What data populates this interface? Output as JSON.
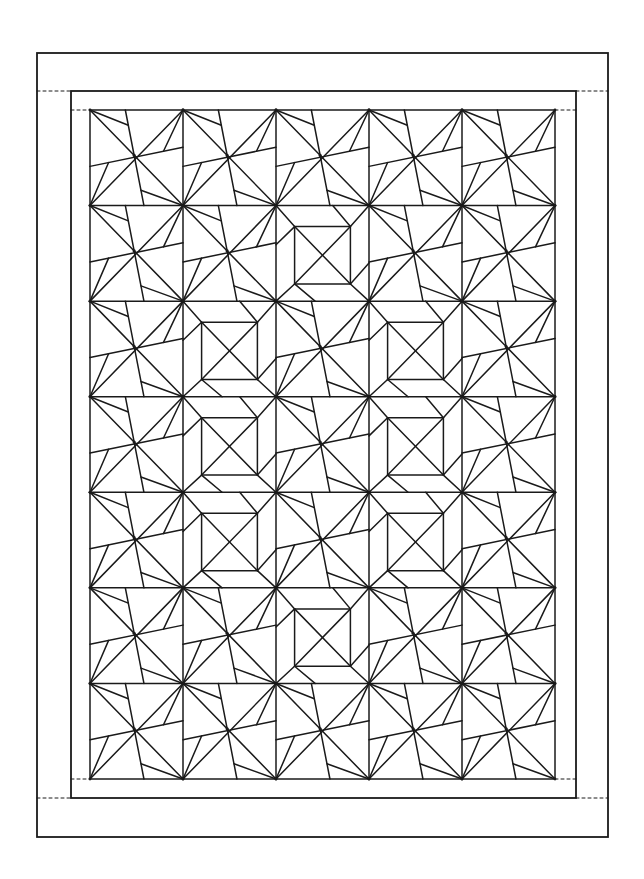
{
  "diagram": {
    "title": "Pinwheel and square-in-square quilt pattern",
    "stroke_color": "#1a1a1a",
    "background": "#ffffff",
    "outer_border": {
      "x1": 37,
      "y1": 53,
      "x2": 608,
      "y2": 837,
      "stroke_width": 1.8
    },
    "middle_border": {
      "x1": 71,
      "y1": 91,
      "x2": 576,
      "y2": 798,
      "stroke_width": 1.8
    },
    "quilt_field": {
      "x1": 90,
      "y1": 110,
      "x2": 555,
      "y2": 779,
      "cols": 5,
      "rows": 7,
      "stroke_width": 1.5
    },
    "dashed_guides": [
      {
        "x1": 37,
        "y1": 91,
        "x2": 71,
        "y2": 91
      },
      {
        "x1": 71,
        "y1": 110,
        "x2": 90,
        "y2": 110
      },
      {
        "x1": 555,
        "y1": 110,
        "x2": 576,
        "y2": 110
      },
      {
        "x1": 576,
        "y1": 91,
        "x2": 608,
        "y2": 91
      },
      {
        "x1": 71,
        "y1": 779,
        "x2": 90,
        "y2": 779
      },
      {
        "x1": 37,
        "y1": 798,
        "x2": 71,
        "y2": 798
      },
      {
        "x1": 555,
        "y1": 779,
        "x2": 576,
        "y2": 779
      },
      {
        "x1": 576,
        "y1": 798,
        "x2": 608,
        "y2": 798
      }
    ],
    "block_types": {
      "P": "pinwheel",
      "S": "square-in-square"
    },
    "layout": [
      [
        "P",
        "P",
        "P",
        "P",
        "P"
      ],
      [
        "P",
        "P",
        "S",
        "P",
        "P"
      ],
      [
        "P",
        "S",
        "P",
        "S",
        "P"
      ],
      [
        "P",
        "S",
        "P",
        "S",
        "P"
      ],
      [
        "P",
        "S",
        "P",
        "S",
        "P"
      ],
      [
        "P",
        "P",
        "S",
        "P",
        "P"
      ],
      [
        "P",
        "P",
        "P",
        "P",
        "P"
      ]
    ],
    "pinwheel_geometry": {
      "vertical_top_x": 0.38,
      "vertical_bottom_x": 0.58,
      "horizontal_left_y": 0.59,
      "horizontal_right_y": 0.39,
      "arm_tl_t": 0.16,
      "arm_tr_t": 0.79,
      "arm_br_t": 0.84,
      "arm_bl_t": 0.2
    },
    "square_geometry": {
      "inner_x1": 0.2,
      "inner_x2": 0.8,
      "inner_y1": 0.22,
      "inner_y2": 0.82,
      "arm_left_y": 0.41,
      "arm_top_x": 0.61,
      "arm_right_y": 0.6,
      "arm_bottom_x": 0.42
    }
  }
}
